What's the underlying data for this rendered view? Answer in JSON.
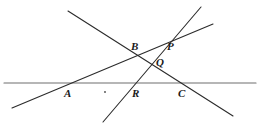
{
  "figure": {
    "type": "geometry-line-diagram",
    "width": 262,
    "height": 131,
    "background_color": "#ffffff",
    "stroke_color": "#2b2b2b",
    "horizontal_line_color": "#6e6e6e",
    "stroke_width": 1.1,
    "lines": [
      {
        "name": "horizontal-baseline",
        "x1": 4,
        "y1": 83,
        "x2": 256,
        "y2": 83,
        "color": "#6e6e6e",
        "width": 1.2
      },
      {
        "name": "line-through-B-Q-C",
        "x1": 68,
        "y1": 11,
        "x2": 233,
        "y2": 116,
        "color": "#2b2b2b",
        "width": 1.1
      },
      {
        "name": "line-through-A-B-P",
        "x1": 12,
        "y1": 108,
        "x2": 213,
        "y2": 24,
        "color": "#2b2b2b",
        "width": 1.1
      },
      {
        "name": "line-through-R-Q-P",
        "x1": 103,
        "y1": 122,
        "x2": 201,
        "y2": 7,
        "color": "#2b2b2b",
        "width": 1.1
      }
    ],
    "dot": {
      "name": "stray-dot",
      "cx": 105,
      "cy": 92,
      "r": 0.9,
      "color": "#4a4a4a"
    },
    "labels": [
      {
        "id": "A",
        "text": "A",
        "x": 64,
        "y": 88
      },
      {
        "id": "B",
        "text": "B",
        "x": 131,
        "y": 41
      },
      {
        "id": "P",
        "text": "P",
        "x": 167,
        "y": 41
      },
      {
        "id": "Q",
        "text": "Q",
        "x": 156,
        "y": 57
      },
      {
        "id": "R",
        "text": "R",
        "x": 132,
        "y": 88
      },
      {
        "id": "C",
        "text": "C",
        "x": 178,
        "y": 88
      }
    ]
  }
}
